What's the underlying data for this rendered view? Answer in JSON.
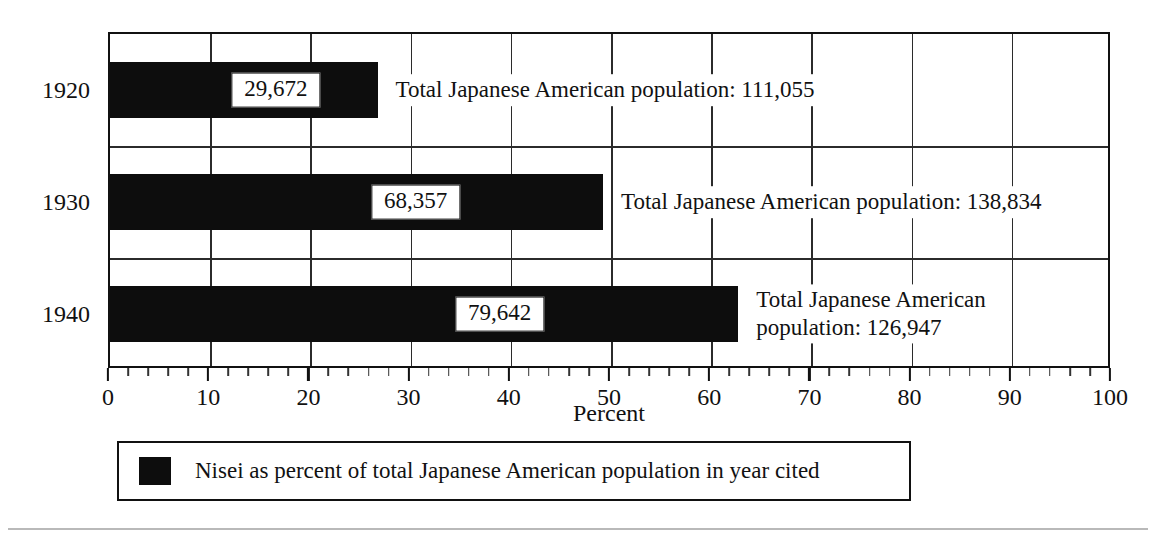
{
  "chart_data": {
    "type": "bar",
    "orientation": "horizontal",
    "title": "",
    "xlabel": "Percent",
    "ylabel": "",
    "xlim": [
      0,
      100
    ],
    "grid": true,
    "legend_position": "bottom",
    "categories": [
      "1920",
      "1930",
      "1940"
    ],
    "series": [
      {
        "name": "Nisei as percent of total Japanese American population in year cited",
        "color": "#0d0d0d",
        "values": [
          26.7,
          49.2,
          62.7
        ]
      }
    ],
    "point_labels": [
      "29,672",
      "68,357",
      "79,642"
    ],
    "annotations": [
      "Total Japanese American population: 111,055",
      "Total Japanese American population: 138,834",
      "Total Japanese American\npopulation: 126,947"
    ],
    "xticks": [
      0,
      10,
      20,
      30,
      40,
      50,
      60,
      70,
      80,
      90,
      100
    ],
    "xtick_labels": [
      "0",
      "10",
      "20",
      "30",
      "40",
      "50",
      "60",
      "70",
      "80",
      "90",
      "100"
    ],
    "xtick_minor_step": 2
  },
  "rows": [
    {
      "year": "1920",
      "percent": 26.7,
      "nisei_count": "29,672",
      "annotation": "Total Japanese American population: 111,055",
      "annotation_lines": [
        "Total Japanese American population: 111,055"
      ]
    },
    {
      "year": "1930",
      "percent": 49.2,
      "nisei_count": "68,357",
      "annotation": "Total Japanese American population: 138,834",
      "annotation_lines": [
        "Total Japanese American population: 138,834"
      ]
    },
    {
      "year": "1940",
      "percent": 62.7,
      "nisei_count": "79,642",
      "annotation": "Total Japanese American\npopulation: 126,947",
      "annotation_lines": [
        "Total Japanese American",
        "population: 126,947"
      ]
    }
  ],
  "axis": {
    "x_title": "Percent",
    "ticks": [
      "0",
      "10",
      "20",
      "30",
      "40",
      "50",
      "60",
      "70",
      "80",
      "90",
      "100"
    ]
  },
  "legend": {
    "swatch_color": "#0d0d0d",
    "label": "Nisei as percent of total Japanese American population in year cited"
  },
  "colors": {
    "bar": "#0d0d0d",
    "frame": "#111111",
    "gridline": "#2b2b2b",
    "background": "#ffffff",
    "footer_rule": "#b9b9b9"
  }
}
